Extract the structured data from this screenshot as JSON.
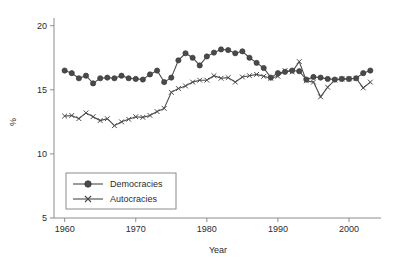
{
  "chart_data": {
    "type": "line",
    "title": "",
    "xlabel": "Year",
    "ylabel": "%",
    "xlim": [
      1958.5,
      2004.5
    ],
    "ylim": [
      5,
      20.6
    ],
    "grid": false,
    "legend_position": "lower-left",
    "x_ticks": [
      1960,
      1970,
      1980,
      1990,
      2000
    ],
    "y_ticks": [
      5,
      10,
      15,
      20
    ],
    "x": [
      1960,
      1961,
      1962,
      1963,
      1964,
      1965,
      1966,
      1967,
      1968,
      1969,
      1970,
      1971,
      1972,
      1973,
      1974,
      1975,
      1976,
      1977,
      1978,
      1979,
      1980,
      1981,
      1982,
      1983,
      1984,
      1985,
      1986,
      1987,
      1988,
      1989,
      1990,
      1991,
      1992,
      1993,
      1994,
      1995,
      1996,
      1997,
      1998,
      1999,
      2000,
      2001,
      2002,
      2003
    ],
    "series": [
      {
        "name": "Democracies",
        "marker": "filled-circle",
        "color": "#4a4a4a",
        "values": [
          16.5,
          16.3,
          15.9,
          16.1,
          15.5,
          15.9,
          15.95,
          15.9,
          16.1,
          15.9,
          15.85,
          15.8,
          16.2,
          16.5,
          15.6,
          15.95,
          17.3,
          17.85,
          17.5,
          16.9,
          17.6,
          17.9,
          18.15,
          18.1,
          17.85,
          18.0,
          17.5,
          17.1,
          16.7,
          15.95,
          16.3,
          16.4,
          16.5,
          16.45,
          15.8,
          16.0,
          15.95,
          15.85,
          15.8,
          15.85,
          15.85,
          15.9,
          16.3,
          16.5
        ]
      },
      {
        "name": "Autocracies",
        "marker": "x",
        "color": "#4a4a4a",
        "values": [
          12.95,
          13.0,
          12.75,
          13.2,
          12.9,
          12.6,
          12.75,
          12.2,
          12.5,
          12.7,
          12.9,
          12.85,
          13.0,
          13.3,
          13.55,
          14.8,
          15.1,
          15.3,
          15.6,
          15.75,
          15.75,
          16.1,
          15.9,
          15.95,
          15.6,
          16.0,
          16.1,
          16.2,
          16.05,
          15.9,
          16.05,
          16.5,
          16.4,
          17.2,
          15.7,
          15.6,
          14.45,
          15.2,
          15.75,
          15.85,
          15.85,
          15.9,
          15.15,
          15.6
        ]
      }
    ]
  },
  "legend": {
    "entries": [
      {
        "label": "Democracies"
      },
      {
        "label": "Autocracies"
      }
    ]
  },
  "axes": {
    "y_label": "%",
    "x_label": "Year",
    "y_tick_labels": [
      "20",
      "15",
      "10",
      "5"
    ],
    "x_tick_labels": [
      "1960",
      "1970",
      "1980",
      "1990",
      "2000"
    ]
  }
}
